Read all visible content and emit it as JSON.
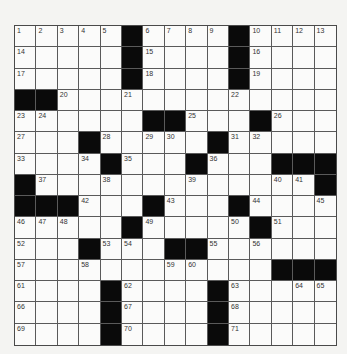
{
  "puzzle": {
    "size": {
      "rows": 15,
      "cols": 15
    },
    "grid": [
      [
        "1",
        "2",
        "3",
        "4",
        "5",
        "#",
        "6",
        "7",
        "8",
        "9",
        "#",
        "10",
        "11",
        "12",
        "13"
      ],
      [
        "14",
        "",
        "",
        "",
        "",
        "#",
        "15",
        "",
        "",
        "",
        "#",
        "16",
        "",
        "",
        ""
      ],
      [
        "17",
        "",
        "",
        "",
        "",
        "#",
        "18",
        "",
        "",
        "",
        "#",
        "19",
        "",
        "",
        ""
      ],
      [
        "#",
        "#",
        "20",
        "",
        "",
        "21",
        "",
        "",
        "",
        "",
        "22",
        "",
        "",
        "",
        ""
      ],
      [
        "23",
        "24",
        "",
        "",
        "",
        "",
        "#",
        "#",
        "25",
        "",
        "",
        "#",
        "26",
        "",
        ""
      ],
      [
        "27",
        "",
        "",
        "#",
        "28",
        "",
        "29",
        "30",
        "",
        "#",
        "31",
        "32",
        "",
        "",
        ""
      ],
      [
        "33",
        "",
        "",
        "34",
        "#",
        "35",
        "",
        "",
        "#",
        "36",
        "",
        "",
        "#",
        "#",
        "#"
      ],
      [
        "#",
        "37",
        "",
        "",
        "38",
        "",
        "",
        "",
        "39",
        "",
        "",
        "",
        "40",
        "41",
        "#"
      ],
      [
        "#",
        "#",
        "#",
        "42",
        "",
        "",
        "#",
        "43",
        "",
        "",
        "#",
        "44",
        "",
        "",
        "45"
      ],
      [
        "46",
        "47",
        "48",
        "",
        "",
        "#",
        "49",
        "",
        "",
        "",
        "50",
        "#",
        "51",
        "",
        ""
      ],
      [
        "52",
        "",
        "",
        "#",
        "53",
        "54",
        "",
        "#",
        "#",
        "55",
        "",
        "56",
        "",
        "",
        ""
      ],
      [
        "57",
        "",
        "",
        "58",
        "",
        "",
        "",
        "59",
        "60",
        "",
        "",
        "",
        "#",
        "#",
        "#"
      ],
      [
        "61",
        "",
        "",
        "",
        "#",
        "62",
        "",
        "",
        "",
        "#",
        "63",
        "",
        "",
        "64",
        "65"
      ],
      [
        "66",
        "",
        "",
        "",
        "#",
        "67",
        "",
        "",
        "",
        "#",
        "68",
        "",
        "",
        "",
        ""
      ],
      [
        "69",
        "",
        "",
        "",
        "#",
        "70",
        "",
        "",
        "",
        "#",
        "71",
        "",
        "",
        "",
        ""
      ]
    ],
    "colors": {
      "black_square": "#0a0a0a",
      "white_square": "#fbfbfa",
      "grid_line": "#5a5a5a",
      "number_text": "#333333"
    }
  }
}
